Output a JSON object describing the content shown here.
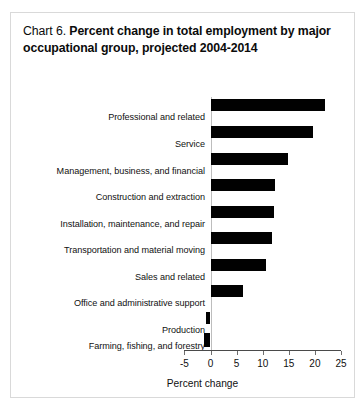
{
  "figure": {
    "label": "Chart 6.",
    "title": "Percent change in total employment by major occupational group, projected 2004-2014"
  },
  "chart_data": {
    "type": "bar",
    "orientation": "horizontal",
    "title": "Chart 6.  Percent change in total employment by major occupational group, projected 2004-2014",
    "xlabel": "Percent change",
    "ylabel": "",
    "xlim": [
      -5,
      25
    ],
    "xticks": [
      -5,
      0,
      5,
      10,
      15,
      20,
      25
    ],
    "xtick_labels": [
      "-5",
      "0",
      "5",
      "10",
      "15",
      "20",
      "25"
    ],
    "grid": false,
    "legend": null,
    "bar_color": "#010101",
    "categories": [
      "Professional and related",
      "Service",
      "Management, business, and financial",
      "Construction and extraction",
      "Installation, maintenance, and repair",
      "Transportation and material moving",
      "Sales and related",
      "Office and administrative support",
      "Production",
      "Farming, fishing, and forestry"
    ],
    "values": [
      21.9,
      19.6,
      14.9,
      12.4,
      12.2,
      11.8,
      10.7,
      6.3,
      -0.8,
      -1.2
    ]
  },
  "axis": {
    "tick_labels": [
      "-5",
      "0",
      "5",
      "10",
      "15",
      "20",
      "25"
    ],
    "title": "Percent change"
  }
}
